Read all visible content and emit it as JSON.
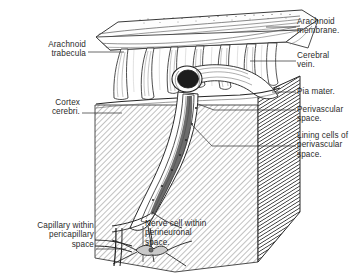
{
  "figure": {
    "background_color": "#ffffff",
    "ink_color": "#1a1a1a",
    "hatch_color": "#8a8a8a",
    "labels_right": [
      {
        "id": "arachnoid-membrane",
        "text": "Arachnoid\nmembrane.",
        "x": 297,
        "y": 18,
        "leader_from_x": 296,
        "leader_from_y": 27,
        "leader_to_x": 268,
        "leader_to_y": 27
      },
      {
        "id": "cerebral-vein",
        "text": "Cerebral\nvein.",
        "x": 297,
        "y": 52,
        "leader_from_x": 296,
        "leader_from_y": 61,
        "leader_to_x": 250,
        "leader_to_y": 61
      },
      {
        "id": "pia-mater",
        "text": "Pia mater.",
        "x": 297,
        "y": 88,
        "leader_from_x": 296,
        "leader_from_y": 92,
        "leader_to_x": 272,
        "leader_to_y": 92
      },
      {
        "id": "perivascular-space",
        "text": "Perivascular\nspace.",
        "x": 297,
        "y": 106,
        "leader_from_x": 296,
        "leader_from_y": 110,
        "leader_to_x": 214,
        "leader_to_y": 110
      },
      {
        "id": "lining-cells",
        "text": "Lining cells of\nperivascular\nspace.",
        "x": 297,
        "y": 132,
        "leader_from_x": 296,
        "leader_from_y": 146,
        "leader_to_x": 212,
        "leader_to_y": 146
      }
    ],
    "labels_left": [
      {
        "id": "arachnoid-trabecula",
        "text": "Arachnoid\ntrabecula",
        "x": 24,
        "y": 41,
        "leader_from_x": 88,
        "leader_from_y": 52,
        "leader_to_x": 124,
        "leader_to_y": 52
      },
      {
        "id": "cortex-cerebri",
        "text": "Cortex\ncerebri.",
        "x": 30,
        "y": 99,
        "leader_from_x": 82,
        "leader_from_y": 113,
        "leader_to_x": 120,
        "leader_to_y": 113
      },
      {
        "id": "capillary-pericapillary",
        "text": "Capillary within\npericapillary\nspace",
        "x": 8,
        "y": 222,
        "leader_from_x": 96,
        "leader_from_y": 249,
        "leader_to_x": 126,
        "leader_to_y": 249
      }
    ],
    "labels_inner": [
      {
        "id": "nerve-cell-perineuronal",
        "text": "Nerve cell within\nperineuronal\nspace.",
        "x": 145,
        "y": 220
      }
    ],
    "structures": [
      {
        "name": "arachnoid-membrane-slab",
        "description": "Horizontal stippled membrane sheet across the top of the block"
      },
      {
        "name": "arachnoid-trabeculae",
        "description": "Vertical strand pillars spanning the subarachnoid space"
      },
      {
        "name": "subarachnoid-space",
        "description": "Open space between arachnoid membrane and pia mater"
      },
      {
        "name": "cerebral-vein",
        "description": "Cut tube with dark elliptical lumen crossing the subarachnoid space"
      },
      {
        "name": "pia-mater",
        "description": "Thin membrane covering the cortical surface"
      },
      {
        "name": "cortex-cerebri-block",
        "description": "Hatched block of cerebral cortex forming the lower body"
      },
      {
        "name": "cortex-cut-face",
        "description": "Dense diagonally hatched right-hand cut face of the cortex block"
      },
      {
        "name": "descending-vessel",
        "description": "Vessel plunging into the cortex surrounded by perivascular space"
      },
      {
        "name": "nerve-cell",
        "description": "Star-shaped neuron within its perineuronal space"
      },
      {
        "name": "capillary",
        "description": "Capillary within pericapillary space at lower left"
      }
    ]
  }
}
